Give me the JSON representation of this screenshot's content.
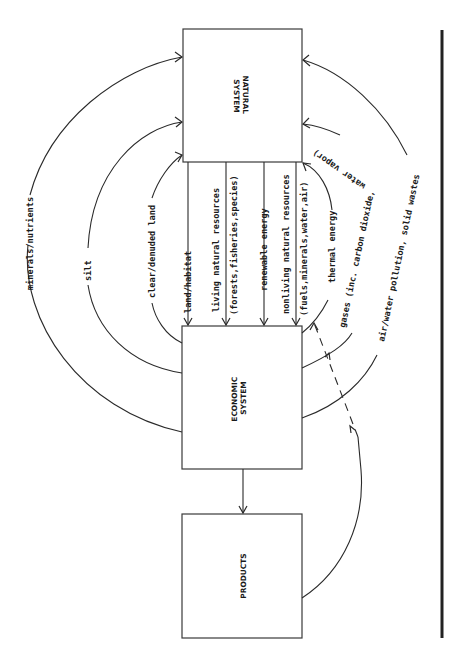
{
  "diagram": {
    "orientation": "rotated 90 degrees counter-clockwise",
    "nodes": {
      "natural_system": {
        "line1": "NATURAL",
        "line2": "SYSTEM"
      },
      "economic_system": {
        "line1": "ECONOMIC",
        "line2": "SYSTEM"
      },
      "products": {
        "label": "PRODUCTS"
      }
    },
    "flows_natural_to_economic": [
      {
        "id": "land-habitat",
        "label": "land/habitat"
      },
      {
        "id": "living-resources",
        "label": "living natural resources",
        "sublabel": "(forests,fisheries,species)"
      },
      {
        "id": "renewable-energy",
        "label": "renewable energy"
      },
      {
        "id": "nonliving-resources",
        "label": "nonliving natural resources",
        "sublabel": "(fuels,minerals,water,air)"
      }
    ],
    "flows_economic_to_natural": [
      {
        "id": "minerals-nutrients",
        "label": "minerals/nutrients"
      },
      {
        "id": "silt",
        "label": "silt"
      },
      {
        "id": "clear-denuded-land",
        "label": "clear/denuded land"
      },
      {
        "id": "thermal-energy",
        "label": "thermal energy"
      },
      {
        "id": "gases",
        "label": "gases (inc. carbon dioxide,",
        "label_cont": "water vapor)"
      },
      {
        "id": "air-water-pollution",
        "label": "air/water pollution, solid wastes"
      }
    ],
    "flows_other": [
      {
        "id": "economic-to-products",
        "label": ""
      },
      {
        "id": "products-to-waste",
        "label": ""
      }
    ],
    "colors": {
      "line": "#2a2a2a",
      "box_border": "#3a3a3a",
      "background": "#ffffff",
      "margin_bar": "#222222"
    }
  }
}
